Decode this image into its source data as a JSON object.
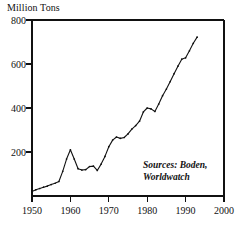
{
  "chart_data": {
    "type": "line",
    "title": "",
    "subtitle": "",
    "ylabel": "Million Tons",
    "xlabel": "",
    "xlim": [
      1950,
      2000
    ],
    "ylim": [
      0,
      800
    ],
    "yticks": [
      200,
      400,
      600,
      800
    ],
    "xticks": [
      1950,
      1960,
      1970,
      1980,
      1990,
      2000
    ],
    "grid": false,
    "legend": null,
    "annotations": [
      {
        "name": "source-note",
        "lines": [
          "Sources: Boden,",
          "Worldwatch"
        ],
        "style": "italic"
      }
    ],
    "series": [
      {
        "name": "Million Tons",
        "color": "#111111",
        "marker": "dot",
        "x": [
          1950,
          1951,
          1952,
          1953,
          1954,
          1955,
          1956,
          1957,
          1958,
          1959,
          1960,
          1961,
          1962,
          1963,
          1964,
          1965,
          1966,
          1967,
          1968,
          1969,
          1970,
          1971,
          1972,
          1973,
          1974,
          1975,
          1976,
          1977,
          1978,
          1979,
          1980,
          1981,
          1982,
          1983,
          1984,
          1985,
          1986,
          1987,
          1988,
          1989,
          1990,
          1991,
          1992,
          1993
        ],
        "values": [
          20,
          28,
          34,
          40,
          45,
          52,
          58,
          66,
          112,
          168,
          210,
          168,
          124,
          118,
          120,
          134,
          136,
          116,
          145,
          180,
          224,
          254,
          268,
          262,
          266,
          282,
          304,
          320,
          340,
          382,
          400,
          396,
          384,
          418,
          456,
          486,
          520,
          556,
          590,
          622,
          628,
          660,
          694,
          722
        ]
      }
    ]
  },
  "axis_labels": {
    "y": [
      "800",
      "600",
      "400",
      "200"
    ],
    "x": [
      "1950",
      "1960",
      "1970",
      "1980",
      "1990",
      "2000"
    ]
  },
  "source": {
    "line1": "Sources: Boden,",
    "line2": "Worldwatch"
  },
  "colors": {
    "line": "#111111",
    "frame": "#111111",
    "background": "#ffffff",
    "text": "#111111"
  }
}
